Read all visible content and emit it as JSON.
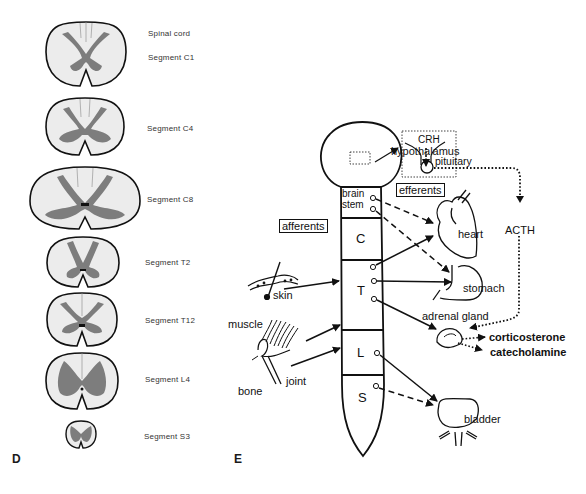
{
  "panel_d": {
    "label": "D",
    "title": "Spinal cord",
    "segments": [
      {
        "name": "Segment C1"
      },
      {
        "name": "Segment C4"
      },
      {
        "name": "Segment C8"
      },
      {
        "name": "Segment T2"
      },
      {
        "name": "Segment T12"
      },
      {
        "name": "Segment L4"
      },
      {
        "name": "Segment S3"
      }
    ],
    "colors": {
      "white_matter": "#ededed",
      "gray_matter": "#7d7d7d",
      "outline": "#111111"
    }
  },
  "panel_e": {
    "label": "E",
    "cord_regions": {
      "brainstem_line1": "brain",
      "brainstem_line2": "stem",
      "cervical": "C",
      "thoracic": "T",
      "lumbar": "L",
      "sacral": "S"
    },
    "boxes": {
      "afferents": "afferents",
      "efferents": "efferents"
    },
    "labels": {
      "hypothalamus": "hypothalamus",
      "crh": "CRH",
      "pituitary": "pituitary",
      "acth": "ACTH",
      "heart": "heart",
      "stomach": "stomach",
      "adrenal_gland": "adrenal gland",
      "corticosterone": "corticosterone",
      "catecholamine": "catecholamine",
      "bladder": "bladder",
      "skin": "skin",
      "muscle": "muscle",
      "bone": "bone",
      "joint": "joint"
    }
  }
}
